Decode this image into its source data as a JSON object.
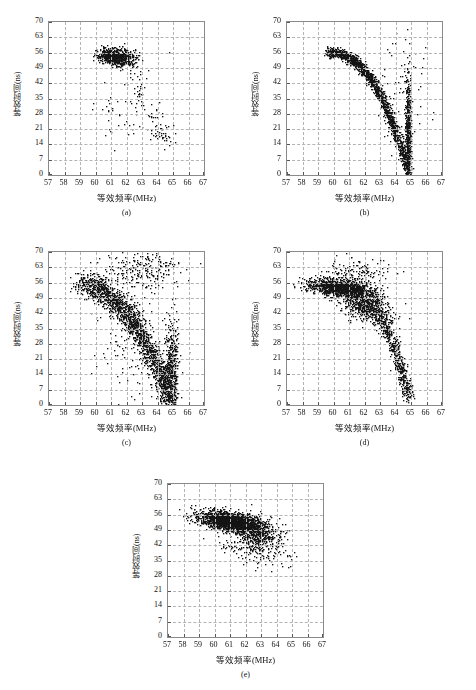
{
  "figure": {
    "panels": [
      {
        "id": "a",
        "label": "(a)",
        "xlabel": "等效频率(MHz)",
        "ylabel": "等效时间(ns)"
      },
      {
        "id": "b",
        "label": "(b)",
        "xlabel": "等效频率(MHz)",
        "ylabel": "等效时间(ns)"
      },
      {
        "id": "c",
        "label": "(c)",
        "xlabel": "等效频率(MHz)",
        "ylabel": "等效时间(ns)"
      },
      {
        "id": "d",
        "label": "(d)",
        "xlabel": "等效频率(MHz)",
        "ylabel": "等效时间(ns)"
      },
      {
        "id": "e",
        "label": "(e)",
        "xlabel": "等效频率(MHz)",
        "ylabel": "等效时间(ns)"
      }
    ],
    "marker_color": "#151515",
    "grid_color": "#b4b4b4",
    "frame_color": "#8a8a8a"
  },
  "chart_data": [
    {
      "type": "scatter",
      "id": "a",
      "title": "(a)",
      "xlabel": "等效频率(MHz)",
      "ylabel": "等效时间(ns)",
      "xlim": [
        57,
        67
      ],
      "ylim": [
        0,
        70
      ],
      "xticks": [
        57,
        58,
        59,
        60,
        61,
        62,
        63,
        64,
        65,
        66,
        67
      ],
      "yticks": [
        0,
        7,
        14,
        21,
        28,
        35,
        42,
        49,
        56,
        63,
        70
      ],
      "grid": true,
      "legend": "none",
      "n_points": 900,
      "clusters": [
        {
          "name": "main-blob",
          "n": 760,
          "cx": 61.3,
          "cy": 54.3,
          "sx": 0.55,
          "sy": 1.9,
          "rot": -0.12
        },
        {
          "name": "sparse-tail",
          "n": 95,
          "path": [
            [
              62.3,
              50
            ],
            [
              62.8,
              44
            ],
            [
              63.0,
              36
            ],
            [
              63.3,
              29
            ],
            [
              63.9,
              24
            ],
            [
              64.4,
              19
            ],
            [
              64.8,
              15
            ]
          ],
          "spread_x": 0.35,
          "spread_y": 3.2
        },
        {
          "name": "stragglers",
          "n": 45,
          "cx": 61.6,
          "cy": 30,
          "sx": 1.3,
          "sy": 10.0,
          "rot": 0
        }
      ]
    },
    {
      "type": "scatter",
      "id": "b",
      "title": "(b)",
      "xlabel": "等效频率(MHz)",
      "ylabel": "等效时间(ns)",
      "xlim": [
        57,
        67
      ],
      "ylim": [
        0,
        70
      ],
      "xticks": [
        57,
        58,
        59,
        60,
        61,
        62,
        63,
        64,
        65,
        66,
        67
      ],
      "yticks": [
        0,
        7,
        14,
        21,
        28,
        35,
        42,
        49,
        56,
        63,
        70
      ],
      "grid": true,
      "legend": "none",
      "n_points": 2100,
      "clusters": [
        {
          "name": "arc",
          "n": 1500,
          "arc": {
            "x0": 59.5,
            "y0": 56.5,
            "xa": 64.75,
            "ya": 3.0,
            "bend": 2.4
          },
          "spread_x": 0.14,
          "spread_y": 1.2
        },
        {
          "name": "asymptote",
          "n": 520,
          "cx": 64.78,
          "cy": 18,
          "sx": 0.1,
          "sy": 14.0,
          "rot": 0
        },
        {
          "name": "outliers",
          "n": 80,
          "cx": 64.3,
          "cy": 35,
          "sx": 0.9,
          "sy": 17.0,
          "rot": 0
        }
      ]
    },
    {
      "type": "scatter",
      "id": "c",
      "title": "(c)",
      "xlabel": "等效频率(MHz)",
      "ylabel": "等效时间(ns)",
      "xlim": [
        57,
        67
      ],
      "ylim": [
        0,
        70
      ],
      "xticks": [
        57,
        58,
        59,
        60,
        61,
        62,
        63,
        64,
        65,
        66,
        67
      ],
      "yticks": [
        0,
        7,
        14,
        21,
        28,
        35,
        42,
        49,
        56,
        63,
        70
      ],
      "grid": true,
      "legend": "none",
      "n_points": 2600,
      "clusters": [
        {
          "name": "wide-arc",
          "n": 1750,
          "arc": {
            "x0": 58.85,
            "y0": 55.5,
            "xa": 64.8,
            "ya": 3.0,
            "bend": 2.1
          },
          "spread_x": 0.3,
          "spread_y": 3.0
        },
        {
          "name": "asymptote",
          "n": 480,
          "cx": 64.85,
          "cy": 16,
          "sx": 0.22,
          "sy": 12.0,
          "rot": 0
        },
        {
          "name": "upper-scatter",
          "n": 240,
          "cx": 63.0,
          "cy": 62,
          "sx": 1.3,
          "sy": 4.5,
          "rot": 0
        },
        {
          "name": "inner-scatter",
          "n": 130,
          "cx": 62.4,
          "cy": 30,
          "sx": 1.1,
          "sy": 11.0,
          "rot": 0
        }
      ]
    },
    {
      "type": "scatter",
      "id": "d",
      "title": "(d)",
      "xlabel": "等效频率(MHz)",
      "ylabel": "等效时间(ns)",
      "xlim": [
        57,
        67
      ],
      "ylim": [
        0,
        70
      ],
      "xticks": [
        57,
        58,
        59,
        60,
        61,
        62,
        63,
        64,
        65,
        66,
        67
      ],
      "yticks": [
        0,
        7,
        14,
        21,
        28,
        35,
        42,
        49,
        56,
        63,
        70
      ],
      "grid": true,
      "legend": "none",
      "n_points": 2500,
      "clusters": [
        {
          "name": "head-blob",
          "n": 1150,
          "cx": 60.3,
          "cy": 53.8,
          "sx": 1.0,
          "sy": 1.9,
          "rot": -0.1
        },
        {
          "name": "shoulder",
          "n": 700,
          "cx": 62.0,
          "cy": 46.5,
          "sx": 0.85,
          "sy": 3.6,
          "rot": -0.45
        },
        {
          "name": "descending-tail",
          "n": 520,
          "arc": {
            "x0": 62.6,
            "y0": 44.0,
            "xa": 64.85,
            "ya": 3.5,
            "bend": 1.5
          },
          "spread_x": 0.18,
          "spread_y": 2.0
        },
        {
          "name": "upper-outliers",
          "n": 130,
          "cx": 61.6,
          "cy": 61,
          "sx": 1.1,
          "sy": 3.0,
          "rot": 0
        }
      ]
    },
    {
      "type": "scatter",
      "id": "e",
      "title": "(e)",
      "xlabel": "等效频率(MHz)",
      "ylabel": "等效时间(ns)",
      "xlim": [
        57,
        67
      ],
      "ylim": [
        0,
        70
      ],
      "xticks": [
        57,
        58,
        59,
        60,
        61,
        62,
        63,
        64,
        65,
        66,
        67
      ],
      "yticks": [
        0,
        7,
        14,
        21,
        28,
        35,
        42,
        49,
        56,
        63,
        70
      ],
      "grid": true,
      "legend": "none",
      "n_points": 2400,
      "clusters": [
        {
          "name": "core-blob",
          "n": 1700,
          "cx": 60.9,
          "cy": 53.2,
          "sx": 0.95,
          "sy": 2.0,
          "rot": -0.14
        },
        {
          "name": "right-spread",
          "n": 520,
          "cx": 62.6,
          "cy": 48.5,
          "sx": 0.8,
          "sy": 3.2,
          "rot": -0.3
        },
        {
          "name": "low-outliers",
          "n": 180,
          "cx": 62.4,
          "cy": 41,
          "sx": 1.1,
          "sy": 3.4,
          "rot": -0.2
        }
      ]
    }
  ]
}
